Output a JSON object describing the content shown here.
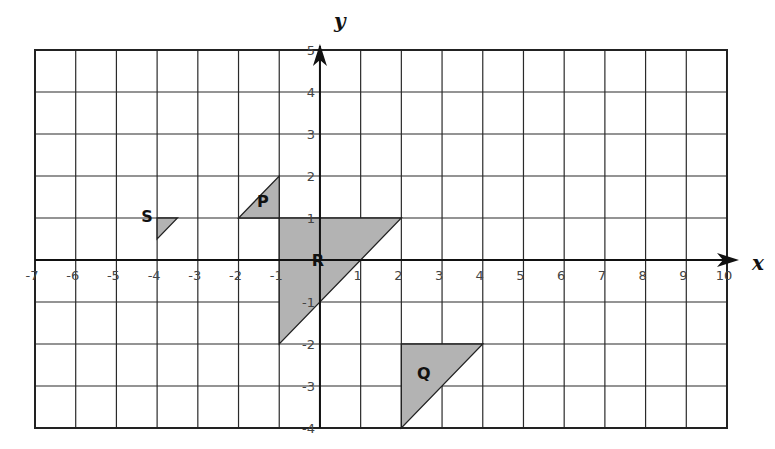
{
  "diagram": {
    "type": "coordinate-grid",
    "x_axis": {
      "label": "x",
      "min": -7,
      "max": 10,
      "ticks": [
        "-7",
        "-6",
        "-5",
        "-4",
        "-3",
        "-2",
        "-1",
        "1",
        "2",
        "3",
        "4",
        "5",
        "6",
        "7",
        "8",
        "9",
        "10"
      ]
    },
    "y_axis": {
      "label": "y",
      "min": -4,
      "max": 5,
      "ticks": [
        "5",
        "4",
        "3",
        "2",
        "1",
        "-1",
        "-2",
        "-3",
        "-4"
      ]
    },
    "shapes": [
      {
        "label": "P",
        "vertices": [
          [
            -2,
            1
          ],
          [
            -1,
            1
          ],
          [
            -1,
            2
          ]
        ],
        "label_pos": [
          -1.4,
          1.4
        ]
      },
      {
        "label": "R",
        "vertices": [
          [
            -1,
            1
          ],
          [
            2,
            1
          ],
          [
            -1,
            -2
          ]
        ],
        "label_pos": [
          -0.05,
          0
        ]
      },
      {
        "label": "Q",
        "vertices": [
          [
            2,
            -2
          ],
          [
            4,
            -2
          ],
          [
            2,
            -4
          ]
        ],
        "label_pos": [
          2.55,
          -2.7
        ]
      },
      {
        "label": "S",
        "vertices": [
          [
            -4,
            1
          ],
          [
            -3.5,
            1
          ],
          [
            -4,
            0.5
          ]
        ],
        "label_pos": [
          -4.25,
          1.05
        ]
      }
    ],
    "colors": {
      "fill": "#b3b3b3",
      "line": "#222222",
      "background": "#ffffff"
    }
  }
}
